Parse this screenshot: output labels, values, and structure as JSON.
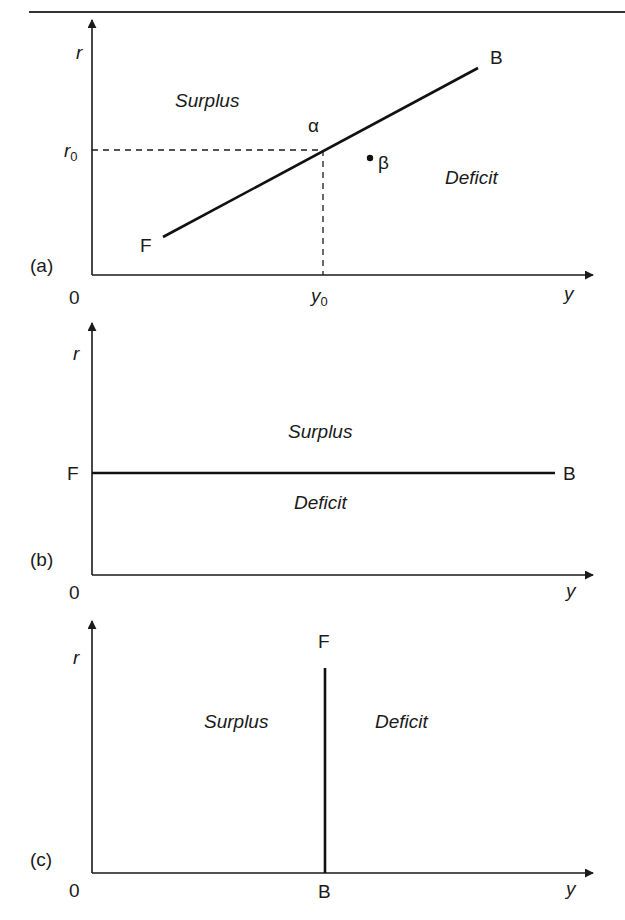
{
  "figure": {
    "panels": [
      {
        "id": "a",
        "panel_label": "(a)",
        "x_axis_label": "y",
        "y_axis_label": "r",
        "origin_label": "0",
        "line_start_label": "F",
        "line_end_label": "B",
        "region_above": "Surplus",
        "region_below": "Deficit",
        "point_on_line_label": "α",
        "point_off_line_label": "β",
        "r_tick_label": "r",
        "r_tick_subscript": "0",
        "y_tick_label": "y",
        "y_tick_subscript": "0",
        "line_type": "upward-sloping"
      },
      {
        "id": "b",
        "panel_label": "(b)",
        "x_axis_label": "y",
        "y_axis_label": "r",
        "origin_label": "0",
        "line_start_label": "F",
        "line_end_label": "B",
        "region_above": "Surplus",
        "region_below": "Deficit",
        "line_type": "horizontal"
      },
      {
        "id": "c",
        "panel_label": "(c)",
        "x_axis_label": "y",
        "y_axis_label": "r",
        "origin_label": "0",
        "line_start_label": "F",
        "line_end_label": "B",
        "region_left": "Surplus",
        "region_right": "Deficit",
        "line_type": "vertical"
      }
    ]
  },
  "colors": {
    "ink": "#1a1a1a",
    "background": "#ffffff"
  }
}
